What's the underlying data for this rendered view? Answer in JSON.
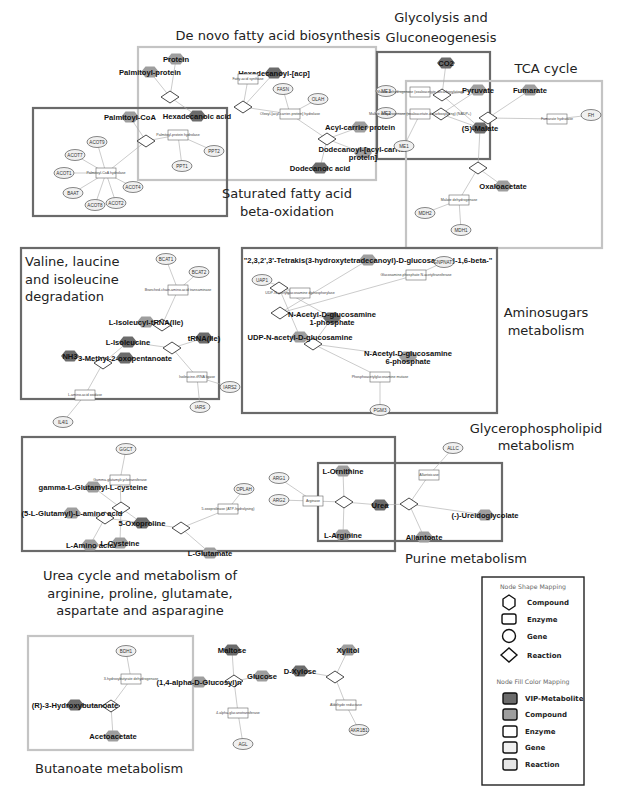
{
  "colors": {
    "vip_metabolite": "#6b6b6b",
    "compound": "#9e9e9e",
    "enzyme": "#ffffff",
    "gene": "#f0f0f0",
    "reaction": "#e6e6e6",
    "edge": "#a8a8a8",
    "box_dark": "#6a6a6a",
    "box_light": "#c4c4c4",
    "legend_border": "#222222"
  },
  "pathways": [
    {
      "id": "denovo",
      "title": "De novo fatty acid biosynthesis",
      "style": "light"
    },
    {
      "id": "satfa",
      "title": "Saturated fatty acid beta-oxidation",
      "style": "dark"
    },
    {
      "id": "glyco",
      "title": "Glycolysis and Gluconeogenesis",
      "style": "dark"
    },
    {
      "id": "tca",
      "title": "TCA cycle",
      "style": "light"
    },
    {
      "id": "valine",
      "title": "Valine, laucine and isoleucine degradation",
      "style": "dark"
    },
    {
      "id": "amino",
      "title": "Aminosugars metabolism",
      "style": "dark"
    },
    {
      "id": "glycero",
      "title": "Glycerophospholipid metabolism",
      "style": "none"
    },
    {
      "id": "urea",
      "title": "Urea cycle and metabolism of arginine, proline, glutamate, aspartate and asparagine",
      "style": "dark"
    },
    {
      "id": "purine",
      "title": "Purine metabolism",
      "style": "dark"
    },
    {
      "id": "butanoate",
      "title": "Butanoate metabolism",
      "style": "light"
    }
  ],
  "nodes": [
    {
      "id": "protein",
      "type": "compound",
      "fill": "compound",
      "label": "Protein"
    },
    {
      "id": "palmitoylprotein",
      "type": "compound",
      "fill": "compound",
      "label": "Palmitoyl-protein"
    },
    {
      "id": "hexacp",
      "type": "compound",
      "fill": "vip",
      "label": "Hexadecanoyl-[acp]"
    },
    {
      "id": "fas",
      "type": "enzyme",
      "label": "Fatty-acid synthase"
    },
    {
      "id": "fasn",
      "type": "gene",
      "label": "FASN"
    },
    {
      "id": "olah",
      "type": "gene",
      "label": "OLAH"
    },
    {
      "id": "oleoyl",
      "type": "enzyme",
      "label": "Oleoyl-[acyl-carrier-protein] hydrolase"
    },
    {
      "id": "acp",
      "type": "compound",
      "fill": "compound",
      "label": "Acyl-carrier protein"
    },
    {
      "id": "dodecacp",
      "type": "compound",
      "fill": "compound",
      "label": "Dodecanoyl-[acyl-carrier protein]"
    },
    {
      "id": "dodecanoic",
      "type": "compound",
      "fill": "vip",
      "label": "Dodecanoic acid"
    },
    {
      "id": "hexadecanoic",
      "type": "compound",
      "fill": "vip",
      "label": "Hexadecanoic acid"
    },
    {
      "id": "palmcoa",
      "type": "compound",
      "fill": "compound",
      "label": "Palmitoyl-CoA"
    },
    {
      "id": "ppt_hyd",
      "type": "enzyme",
      "label": "Palmitoyl-protein hydrolase"
    },
    {
      "id": "ppt1",
      "type": "gene",
      "label": "PPT1"
    },
    {
      "id": "ppt2",
      "type": "gene",
      "label": "PPT2"
    },
    {
      "id": "pcoa_hyd",
      "type": "enzyme",
      "label": "Palmitoyl-CoA hydrolase"
    },
    {
      "id": "acot9",
      "type": "gene",
      "label": "ACOT9"
    },
    {
      "id": "acot7",
      "type": "gene",
      "label": "ACOT7"
    },
    {
      "id": "acot1",
      "type": "gene",
      "label": "ACOT1"
    },
    {
      "id": "baat",
      "type": "gene",
      "label": "BAAT"
    },
    {
      "id": "acot8",
      "type": "gene",
      "label": "ACOT8"
    },
    {
      "id": "acot2",
      "type": "gene",
      "label": "ACOT2"
    },
    {
      "id": "acot4",
      "type": "gene",
      "label": "ACOT4"
    },
    {
      "id": "co2",
      "type": "compound",
      "fill": "vip",
      "label": "CO2"
    },
    {
      "id": "pyruvate",
      "type": "compound",
      "fill": "compound",
      "label": "Pyruvate"
    },
    {
      "id": "me3",
      "type": "gene",
      "label": "ME3"
    },
    {
      "id": "me2",
      "type": "gene",
      "label": "ME2"
    },
    {
      "id": "me1",
      "type": "gene",
      "label": "ME1"
    },
    {
      "id": "malic1",
      "type": "enzyme",
      "label": "Malate dehydrogenase (oxaloacetate-decarboxylating)"
    },
    {
      "id": "malic2",
      "type": "enzyme",
      "label": "Malate dehydrogenase (oxaloacetate-decarboxylating) (NADP+)"
    },
    {
      "id": "fumarate",
      "type": "compound",
      "fill": "compound",
      "label": "Fumarate"
    },
    {
      "id": "fumhyd",
      "type": "enzyme",
      "label": "Fumarate hydratase"
    },
    {
      "id": "fh",
      "type": "gene",
      "label": "FH"
    },
    {
      "id": "malate",
      "type": "compound",
      "fill": "vip",
      "label": "(S)-Malate"
    },
    {
      "id": "oxaloacetate",
      "type": "compound",
      "fill": "compound",
      "label": "Oxaloacetate"
    },
    {
      "id": "mdh",
      "type": "enzyme",
      "label": "Malate dehydrogenase"
    },
    {
      "id": "mdh2",
      "type": "gene",
      "label": "MDH2"
    },
    {
      "id": "mdh1",
      "type": "gene",
      "label": "MDH1"
    },
    {
      "id": "bcat1",
      "type": "gene",
      "label": "BCAT1"
    },
    {
      "id": "bcat2",
      "type": "gene",
      "label": "BCAT2"
    },
    {
      "id": "bcaat",
      "type": "enzyme",
      "label": "Branched-chain-amino-acid transaminase"
    },
    {
      "id": "ileutrna",
      "type": "compound",
      "fill": "compound",
      "label": "L-Isoleucyl-tRNA(Ile)"
    },
    {
      "id": "ile",
      "type": "compound",
      "fill": "vip",
      "label": "L-Isoleucine"
    },
    {
      "id": "trna",
      "type": "compound",
      "fill": "vip",
      "label": "tRNA(Ile)"
    },
    {
      "id": "nh3",
      "type": "compound",
      "fill": "vip",
      "label": "NH3"
    },
    {
      "id": "methyl",
      "type": "compound",
      "fill": "vip",
      "label": "3-Methyl-2-oxopentanoate"
    },
    {
      "id": "ilerna_lig",
      "type": "enzyme",
      "label": "Isoleucine-tRNA ligase"
    },
    {
      "id": "iars2",
      "type": "gene",
      "label": "IARS2"
    },
    {
      "id": "iars",
      "type": "gene",
      "label": "IARS"
    },
    {
      "id": "laao",
      "type": "enzyme",
      "label": "L-amino-acid oxidase"
    },
    {
      "id": "il4i1",
      "type": "gene",
      "label": "IL4I1"
    },
    {
      "id": "tetrakis",
      "type": "compound",
      "fill": "compound",
      "label": "\"2,3,2',3'-Tetrakis(3-hydroxytetradecanoyl)-D-glucosaminyl-1,6-beta-\""
    },
    {
      "id": "gnpna",
      "type": "gene",
      "label": "GNPNAT1"
    },
    {
      "id": "gna",
      "type": "enzyme",
      "label": "Glucosamine-phosphate N-acetyltransferase"
    },
    {
      "id": "uap1",
      "type": "gene",
      "label": "UAP1"
    },
    {
      "id": "udpdp",
      "type": "enzyme",
      "label": "UDP-N-acetylglucosamine diphosphorylase"
    },
    {
      "id": "nag1p",
      "type": "compound",
      "fill": "vip",
      "label": "N-Acetyl-D-glucosamine 1-phosphate"
    },
    {
      "id": "udpnag",
      "type": "compound",
      "fill": "compound",
      "label": "UDP-N-acetyl-D-glucosamine"
    },
    {
      "id": "nag6p",
      "type": "compound",
      "fill": "compound",
      "label": "N-Acetyl-D-glucosamine 6-phosphate"
    },
    {
      "id": "pagm",
      "type": "enzyme",
      "label": "Phosphoacetylglucosamine mutase"
    },
    {
      "id": "pgm3",
      "type": "gene",
      "label": "PGM3"
    },
    {
      "id": "gctg",
      "type": "gene",
      "label": "GGCT"
    },
    {
      "id": "ggct",
      "type": "enzyme",
      "label": "Gamma-glutamylcyclotransferase"
    },
    {
      "id": "gglc",
      "type": "compound",
      "fill": "compound",
      "label": "gamma-L-Glutamyl-L-cysteine"
    },
    {
      "id": "glutaa",
      "type": "compound",
      "fill": "compound",
      "label": "(5-L-Glutamyl)-L-amino acid"
    },
    {
      "id": "oxopro",
      "type": "compound",
      "fill": "vip",
      "label": "5-Oxoproline"
    },
    {
      "id": "laa",
      "type": "compound",
      "fill": "compound",
      "label": "L-Amino acid"
    },
    {
      "id": "cys",
      "type": "compound",
      "fill": "compound",
      "label": "L-Cysteine"
    },
    {
      "id": "oplah",
      "type": "gene",
      "label": "OPLAH"
    },
    {
      "id": "oxoprolinase",
      "type": "enzyme",
      "label": "5-oxoprolinase (ATP-hydrolysing)"
    },
    {
      "id": "glu",
      "type": "compound",
      "fill": "compound",
      "label": "L-Glutamate"
    },
    {
      "id": "arg1",
      "type": "gene",
      "label": "ARG1"
    },
    {
      "id": "arg2",
      "type": "gene",
      "label": "ARG2"
    },
    {
      "id": "arginase",
      "type": "enzyme",
      "label": "Arginase"
    },
    {
      "id": "orn",
      "type": "compound",
      "fill": "compound",
      "label": "L-Ornithine"
    },
    {
      "id": "arg",
      "type": "compound",
      "fill": "compound",
      "label": "L-Arginine"
    },
    {
      "id": "urea",
      "type": "compound",
      "fill": "vip",
      "label": "Urea"
    },
    {
      "id": "allc",
      "type": "gene",
      "label": "ALLC"
    },
    {
      "id": "allantoicase",
      "type": "enzyme",
      "label": "Allantoicase"
    },
    {
      "id": "ureido",
      "type": "compound",
      "fill": "compound",
      "label": "(-)-Ureidoglycolate"
    },
    {
      "id": "allantoate",
      "type": "compound",
      "fill": "compound",
      "label": "Allantoate"
    },
    {
      "id": "bdh1",
      "type": "gene",
      "label": "BDH1"
    },
    {
      "id": "hbdh",
      "type": "enzyme",
      "label": "3-hydroxybutyrate dehydrogenase"
    },
    {
      "id": "rhb",
      "type": "compound",
      "fill": "vip",
      "label": "(R)-3-Hydroxybutanoate"
    },
    {
      "id": "acetoacetate",
      "type": "compound",
      "fill": "compound",
      "label": "Acetoacetate"
    },
    {
      "id": "agluc",
      "type": "compound",
      "fill": "compound",
      "label": "(1,4-alpha-D-Glucosyl)n"
    },
    {
      "id": "maltose",
      "type": "compound",
      "fill": "vip",
      "label": "Maltose"
    },
    {
      "id": "glucose",
      "type": "compound",
      "fill": "compound",
      "label": "Glucose"
    },
    {
      "id": "xylose",
      "type": "compound",
      "fill": "vip",
      "label": "D-Xylose"
    },
    {
      "id": "xylitol",
      "type": "compound",
      "fill": "compound",
      "label": "Xylitol"
    },
    {
      "id": "agt",
      "type": "enzyme",
      "label": "4-alpha-glucanotransferase"
    },
    {
      "id": "agl",
      "type": "gene",
      "label": "AGL"
    },
    {
      "id": "aldred",
      "type": "enzyme",
      "label": "Aldehyde reductase"
    },
    {
      "id": "akr1b1",
      "type": "gene",
      "label": "AKR1B1"
    }
  ],
  "legend": {
    "shape_title": "Node Shape Mapping",
    "shapes": [
      {
        "shape": "hexagon",
        "label": "Compound"
      },
      {
        "shape": "rectangle",
        "label": "Enzyme"
      },
      {
        "shape": "circle",
        "label": "Gene"
      },
      {
        "shape": "diamond",
        "label": "Reaction"
      }
    ],
    "fill_title": "Node Fill Color Mapping",
    "fills": [
      {
        "key": "vip_metabolite",
        "label": "VIP-Metabolite"
      },
      {
        "key": "compound",
        "label": "Compound"
      },
      {
        "key": "enzyme",
        "label": "Enzyme"
      },
      {
        "key": "gene",
        "label": "Gene"
      },
      {
        "key": "reaction",
        "label": "Reaction"
      }
    ]
  }
}
